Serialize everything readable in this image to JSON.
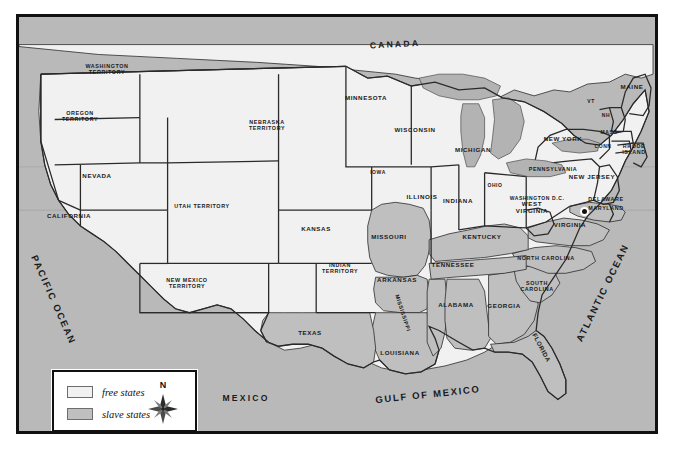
{
  "map": {
    "title_visible": false,
    "colors": {
      "free_state_fill": "#f1f1f1",
      "slave_state_fill": "#bfbfbf",
      "water_fill": "#b9b9b9",
      "border_stroke": "#1a1a1a",
      "frame": "#111111"
    },
    "countries": [
      {
        "name": "CANADA",
        "x": 392,
        "y": 42,
        "rotate": -3
      },
      {
        "name": "MEXICO",
        "x": 243,
        "y": 396,
        "rotate": 0
      }
    ],
    "oceans": [
      {
        "name": "PACIFIC OCEAN",
        "x": 50,
        "y": 297,
        "rotate": 66
      },
      {
        "name": "ATLANTIC OCEAN",
        "x": 600,
        "y": 290,
        "rotate": -64
      },
      {
        "name": "GULF OF MEXICO",
        "x": 425,
        "y": 392,
        "rotate": -6
      }
    ],
    "free_states": [
      {
        "name": "WASHINGTON\nTERRITORY",
        "x": 104,
        "y": 66
      },
      {
        "name": "OREGON\nTERRITORY",
        "x": 77,
        "y": 113
      },
      {
        "name": "NEVADA",
        "x": 94,
        "y": 173
      },
      {
        "name": "CALIFORNIA",
        "x": 66,
        "y": 213
      },
      {
        "name": "UTAH TERRITORY",
        "x": 199,
        "y": 203
      },
      {
        "name": "NEW MEXICO\nTERRITORY",
        "x": 184,
        "y": 280
      },
      {
        "name": "NEBRASKA\nTERRITORY",
        "x": 264,
        "y": 122
      },
      {
        "name": "KANSAS",
        "x": 313,
        "y": 226
      },
      {
        "name": "MINNESOTA",
        "x": 363,
        "y": 95
      },
      {
        "name": "IOWA",
        "x": 375,
        "y": 170
      },
      {
        "name": "WISCONSIN",
        "x": 412,
        "y": 127
      },
      {
        "name": "MICHIGAN",
        "x": 470,
        "y": 147
      },
      {
        "name": "ILLINOIS",
        "x": 419,
        "y": 194
      },
      {
        "name": "INDIANA",
        "x": 455,
        "y": 198
      },
      {
        "name": "OHIO",
        "x": 492,
        "y": 183
      },
      {
        "name": "PENNSYLVANIA",
        "x": 550,
        "y": 166
      },
      {
        "name": "NEW YORK",
        "x": 560,
        "y": 136
      },
      {
        "name": "NEW JERSEY",
        "x": 589,
        "y": 174
      },
      {
        "name": "MAINE",
        "x": 629,
        "y": 84
      },
      {
        "name": "VT",
        "x": 588,
        "y": 99
      },
      {
        "name": "NH",
        "x": 603,
        "y": 113
      },
      {
        "name": "MASS",
        "x": 606,
        "y": 130
      },
      {
        "name": "CONN",
        "x": 600,
        "y": 144
      },
      {
        "name": "RHODE\nISLAND",
        "x": 631,
        "y": 146
      },
      {
        "name": "WEST\nVIRGINIA",
        "x": 529,
        "y": 205
      },
      {
        "name": "INDIAN\nTERRITORY",
        "x": 337,
        "y": 265
      }
    ],
    "slave_states": [
      {
        "name": "MISSOURI",
        "x": 386,
        "y": 234
      },
      {
        "name": "ARKANSAS",
        "x": 394,
        "y": 277
      },
      {
        "name": "KENTUCKY",
        "x": 479,
        "y": 234
      },
      {
        "name": "TENNESSEE",
        "x": 450,
        "y": 262
      },
      {
        "name": "VIRGINIA",
        "x": 567,
        "y": 222
      },
      {
        "name": "NORTH CAROLINA",
        "x": 543,
        "y": 255
      },
      {
        "name": "SOUTH\nCAROLINA",
        "x": 534,
        "y": 283
      },
      {
        "name": "GEORGIA",
        "x": 501,
        "y": 303
      },
      {
        "name": "ALABAMA",
        "x": 453,
        "y": 302
      },
      {
        "name": "MISSISSIPPI",
        "x": 400,
        "y": 310,
        "rotate": 72
      },
      {
        "name": "LOUISIANA",
        "x": 397,
        "y": 350
      },
      {
        "name": "TEXAS",
        "x": 307,
        "y": 330
      },
      {
        "name": "FLORIDA",
        "x": 538,
        "y": 345,
        "rotate": 62
      },
      {
        "name": "DELAWARE",
        "x": 603,
        "y": 196
      },
      {
        "name": "MARYLAND",
        "x": 603,
        "y": 205
      }
    ],
    "city_marker": {
      "name": "WASHINGTON D.C.",
      "label_x": 534,
      "label_y": 196
    }
  },
  "legend": {
    "rows": [
      {
        "label": "free states",
        "swatch": "#f1f1f1"
      },
      {
        "label": "slave states",
        "swatch": "#bfbfbf"
      }
    ],
    "compass_north": "N"
  }
}
